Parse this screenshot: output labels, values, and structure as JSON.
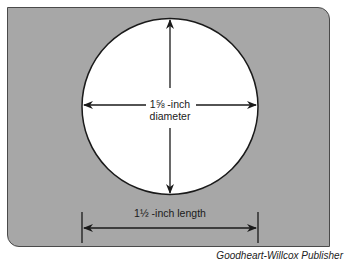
{
  "figure": {
    "background_color": "#a7a7a7",
    "circle_color": "#ffffff",
    "line_color": "#1a1a1a",
    "diameter_label_line1": "1⅝ -inch",
    "diameter_label_line2": "diameter",
    "length_label": "1½ -inch length"
  },
  "credit": "Goodheart-Willcox Publisher"
}
